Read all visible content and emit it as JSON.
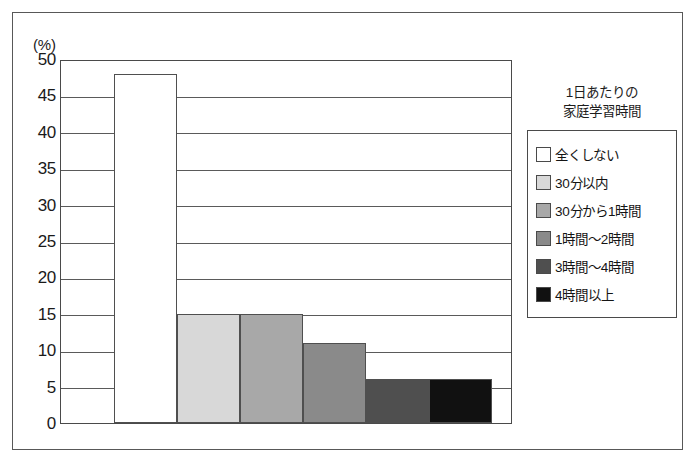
{
  "figure": {
    "unit_label": "(%)"
  },
  "legend": {
    "title_line1": "1日あたりの",
    "title_line2": "家庭学習時間",
    "items": [
      {
        "label": "全くしない",
        "color": "#ffffff"
      },
      {
        "label": "30分以内",
        "color": "#d8d8d8"
      },
      {
        "label": "30分から1時間",
        "color": "#a8a8a8"
      },
      {
        "label": "1時間〜2時間",
        "color": "#8a8a8a"
      },
      {
        "label": "3時間〜4時間",
        "color": "#4f4f4f"
      },
      {
        "label": "4時間以上",
        "color": "#111111"
      }
    ]
  },
  "chart_data": {
    "type": "bar",
    "title": "",
    "xlabel": "",
    "ylabel": "(%)",
    "ylim": [
      0,
      50
    ],
    "yticks": [
      50,
      45,
      40,
      35,
      30,
      25,
      20,
      15,
      10,
      5,
      0
    ],
    "grid": true,
    "legend_position": "right",
    "categories": [
      "全くしない",
      "30分以内",
      "30分から1時間",
      "1時間〜2時間",
      "3時間〜4時間",
      "4時間以上"
    ],
    "values": [
      48,
      15,
      15,
      11,
      6,
      6
    ],
    "colors": [
      "#ffffff",
      "#d8d8d8",
      "#a8a8a8",
      "#8a8a8a",
      "#4f4f4f",
      "#111111"
    ]
  }
}
